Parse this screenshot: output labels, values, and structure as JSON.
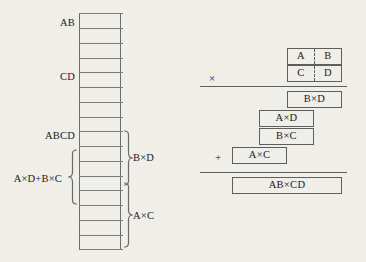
{
  "figure": {
    "type": "diagram",
    "background_color": "#efeee9",
    "line_color": "#5e5e5e"
  },
  "ladder": {
    "name": "bit-position-ladder",
    "rows": 16,
    "labels_left": [
      {
        "text": "AB",
        "row": 1
      },
      {
        "text": "CD",
        "row": 5
      },
      {
        "text": "ABCD",
        "row": 9
      },
      {
        "text": "A×D+B×C",
        "row": 12
      }
    ],
    "labels_right": [
      {
        "text": "B×D",
        "row": 10
      },
      {
        "text": "A×C",
        "row": 14
      }
    ],
    "braces": [
      {
        "side": "right",
        "label": "B×D",
        "spans_rows": "9-12"
      },
      {
        "side": "left",
        "label": "A×D+B×C",
        "spans_rows": "10-14"
      },
      {
        "side": "right",
        "label": "A×C",
        "spans_rows": "12-16"
      }
    ]
  },
  "multiplication": {
    "name": "long-multiplication",
    "operand_top": {
      "left": "A",
      "right": "B"
    },
    "operand_bottom": {
      "left": "C",
      "right": "D"
    },
    "multiply_sign": "×",
    "plus_sign": "+",
    "partial_products": [
      {
        "text": "B×D"
      },
      {
        "text": "A×D"
      },
      {
        "text": "B×C"
      },
      {
        "text": "A×C"
      }
    ],
    "result": "AB×CD"
  }
}
